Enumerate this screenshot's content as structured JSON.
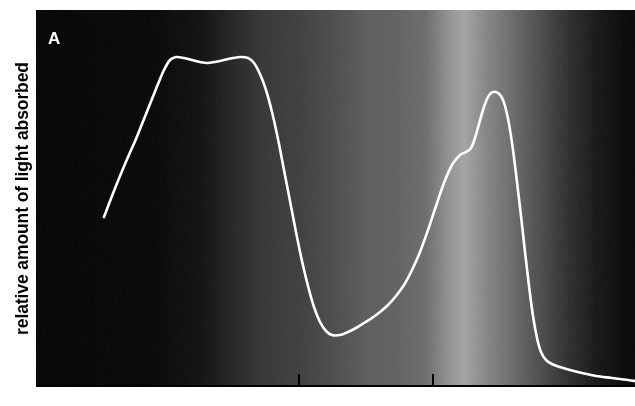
{
  "figure": {
    "panel_label": "A",
    "y_axis_label": "relative amount of light absorbed",
    "x_axis_label": ""
  },
  "chart_data": {
    "type": "line",
    "title": "A",
    "subtitle": "",
    "xlabel": "",
    "ylabel": "relative amount of light absorbed",
    "grid": false,
    "legend": null,
    "axis_style": {
      "x_axis_line_color": "#000000",
      "y_axis_line_color": "#ffffff",
      "plot_background": "visible-light-spectrum-grayscale",
      "curve_color": "#ffffff",
      "curve_width_px": 2.6
    },
    "x_ticks": [
      {
        "label": "",
        "pixel_x": 298
      },
      {
        "label": "",
        "pixel_x": 432
      }
    ],
    "xlim_pixels": [
      36,
      635
    ],
    "ylim_pixels": [
      10,
      386
    ],
    "series": [
      {
        "name": "relative light absorbed",
        "color": "#ffffff",
        "points_pixels": [
          [
            104,
            217
          ],
          [
            112,
            196
          ],
          [
            120,
            176
          ],
          [
            128,
            157
          ],
          [
            136,
            139
          ],
          [
            144,
            119
          ],
          [
            152,
            99
          ],
          [
            158,
            84
          ],
          [
            164,
            70
          ],
          [
            170,
            60
          ],
          [
            176,
            57
          ],
          [
            184,
            58
          ],
          [
            192,
            60
          ],
          [
            200,
            62
          ],
          [
            207,
            63
          ],
          [
            215,
            62
          ],
          [
            224,
            60
          ],
          [
            233,
            58
          ],
          [
            241,
            57
          ],
          [
            248,
            58
          ],
          [
            254,
            63
          ],
          [
            260,
            74
          ],
          [
            266,
            90
          ],
          [
            272,
            112
          ],
          [
            278,
            139
          ],
          [
            284,
            170
          ],
          [
            290,
            201
          ],
          [
            296,
            232
          ],
          [
            302,
            261
          ],
          [
            308,
            286
          ],
          [
            314,
            307
          ],
          [
            320,
            322
          ],
          [
            326,
            331
          ],
          [
            332,
            335
          ],
          [
            340,
            335
          ],
          [
            348,
            332
          ],
          [
            356,
            328
          ],
          [
            364,
            323
          ],
          [
            372,
            318
          ],
          [
            380,
            312
          ],
          [
            388,
            305
          ],
          [
            396,
            296
          ],
          [
            404,
            285
          ],
          [
            412,
            270
          ],
          [
            420,
            252
          ],
          [
            428,
            230
          ],
          [
            436,
            206
          ],
          [
            444,
            183
          ],
          [
            452,
            165
          ],
          [
            460,
            155
          ],
          [
            466,
            152
          ],
          [
            471,
            148
          ],
          [
            475,
            138
          ],
          [
            479,
            124
          ],
          [
            483,
            110
          ],
          [
            487,
            99
          ],
          [
            491,
            93
          ],
          [
            496,
            92
          ],
          [
            501,
            96
          ],
          [
            505,
            106
          ],
          [
            509,
            124
          ],
          [
            513,
            150
          ],
          [
            517,
            182
          ],
          [
            521,
            216
          ],
          [
            525,
            252
          ],
          [
            529,
            286
          ],
          [
            533,
            316
          ],
          [
            537,
            338
          ],
          [
            541,
            352
          ],
          [
            546,
            360
          ],
          [
            552,
            364
          ],
          [
            560,
            367
          ],
          [
            570,
            370
          ],
          [
            582,
            373
          ],
          [
            596,
            376
          ],
          [
            612,
            378
          ],
          [
            628,
            380
          ],
          [
            635,
            381
          ]
        ],
        "features": [
          {
            "kind": "peak",
            "name": "blue-band-plateau-crest-1",
            "pixel_x": 176,
            "pixel_y": 57
          },
          {
            "kind": "local-dip",
            "name": "blue-band-plateau-notch",
            "pixel_x": 207,
            "pixel_y": 63
          },
          {
            "kind": "peak",
            "name": "blue-band-plateau-crest-2",
            "pixel_x": 242,
            "pixel_y": 57
          },
          {
            "kind": "minimum",
            "name": "green-region-trough",
            "pixel_x": 333,
            "pixel_y": 335
          },
          {
            "kind": "shoulder",
            "name": "orange-region-shoulder",
            "pixel_x": 467,
            "pixel_y": 152
          },
          {
            "kind": "peak",
            "name": "red-band-peak",
            "pixel_x": 493,
            "pixel_y": 92
          }
        ]
      }
    ],
    "background_gradient_stops": [
      {
        "pixel_x": 0,
        "color": "#000000"
      },
      {
        "pixel_x": 120,
        "color": "#030303"
      },
      {
        "pixel_x": 165,
        "color": "#0d0d0d"
      },
      {
        "pixel_x": 200,
        "color": "#242424"
      },
      {
        "pixel_x": 230,
        "color": "#343434"
      },
      {
        "pixel_x": 262,
        "color": "#3b3b3b"
      },
      {
        "pixel_x": 300,
        "color": "#4a4a4a"
      },
      {
        "pixel_x": 330,
        "color": "#5a5a5a"
      },
      {
        "pixel_x": 360,
        "color": "#5e5e5e"
      },
      {
        "pixel_x": 390,
        "color": "#6a6a6a"
      },
      {
        "pixel_x": 412,
        "color": "#8e8e8e"
      },
      {
        "pixel_x": 428,
        "color": "#a2a2a2"
      },
      {
        "pixel_x": 448,
        "color": "#868686"
      },
      {
        "pixel_x": 470,
        "color": "#6f6f6f"
      },
      {
        "pixel_x": 500,
        "color": "#4e4e4e"
      },
      {
        "pixel_x": 530,
        "color": "#2e2e2e"
      },
      {
        "pixel_x": 560,
        "color": "#141414"
      },
      {
        "pixel_x": 590,
        "color": "#050505"
      },
      {
        "pixel_x": 635,
        "color": "#000000"
      }
    ]
  }
}
